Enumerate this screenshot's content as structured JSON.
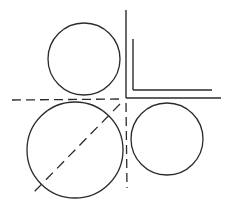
{
  "diagram": {
    "width": 231,
    "height": 207,
    "background": "#ffffff",
    "stroke_color": "#2a2a2a",
    "circles": [
      {
        "name": "top-circle",
        "cx": 84,
        "cy": 59,
        "r": 36
      },
      {
        "name": "large-bottom-left-circle",
        "cx": 75,
        "cy": 150,
        "r": 48
      },
      {
        "name": "right-circle",
        "cx": 167,
        "cy": 139,
        "r": 36
      }
    ],
    "solid_lines": [
      {
        "name": "outer-corner-vertical",
        "x1": 126,
        "y1": 10,
        "x2": 126,
        "y2": 98
      },
      {
        "name": "outer-corner-horizontal",
        "x1": 126,
        "y1": 98,
        "x2": 221,
        "y2": 98
      },
      {
        "name": "inner-corner-vertical",
        "x1": 133,
        "y1": 39,
        "x2": 133,
        "y2": 90
      },
      {
        "name": "inner-corner-horizontal",
        "x1": 133,
        "y1": 90,
        "x2": 212,
        "y2": 90
      }
    ],
    "dashed_lines": [
      {
        "name": "horizontal-dashed-axis",
        "x1": 12,
        "y1": 100,
        "x2": 121,
        "y2": 99
      },
      {
        "name": "vertical-dashed-axis",
        "x1": 126,
        "y1": 103,
        "x2": 127,
        "y2": 188
      },
      {
        "name": "diagonal-dashed-line",
        "x1": 120,
        "y1": 104,
        "x2": 33,
        "y2": 193
      }
    ]
  }
}
